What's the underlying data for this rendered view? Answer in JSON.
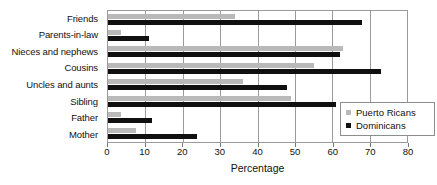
{
  "chart_data": {
    "type": "bar",
    "orientation": "horizontal",
    "title": "",
    "xlabel": "Percentage",
    "ylabel": "",
    "xlim": [
      0,
      80
    ],
    "xticks": [
      0,
      10,
      20,
      30,
      40,
      50,
      60,
      70,
      80
    ],
    "grid": true,
    "grid_axis": "x",
    "legend_position": "lower right",
    "categories": [
      "Friends",
      "Parents-in-law",
      "Nieces and nephews",
      "Cousins",
      "Uncles and aunts",
      "Sibling",
      "Father",
      "Mother"
    ],
    "series": [
      {
        "name": "Puerto Ricans",
        "color": "#b9b9b9",
        "values": [
          34,
          3.5,
          63,
          55,
          36,
          49,
          3.5,
          7.5
        ]
      },
      {
        "name": "Dominicans",
        "color": "#101010",
        "values": [
          68,
          11,
          62,
          73,
          48,
          61,
          11.8,
          23.8
        ]
      }
    ]
  },
  "legend": {
    "items": [
      {
        "label": "Puerto Ricans",
        "swatch": "pr"
      },
      {
        "label": "Dominicans",
        "swatch": "dom"
      }
    ]
  },
  "colors": {
    "puerto_ricans": "#b9b9b9",
    "dominicans": "#101010",
    "axis": "#9a9a9a",
    "text": "#111111",
    "background": "#ffffff"
  }
}
